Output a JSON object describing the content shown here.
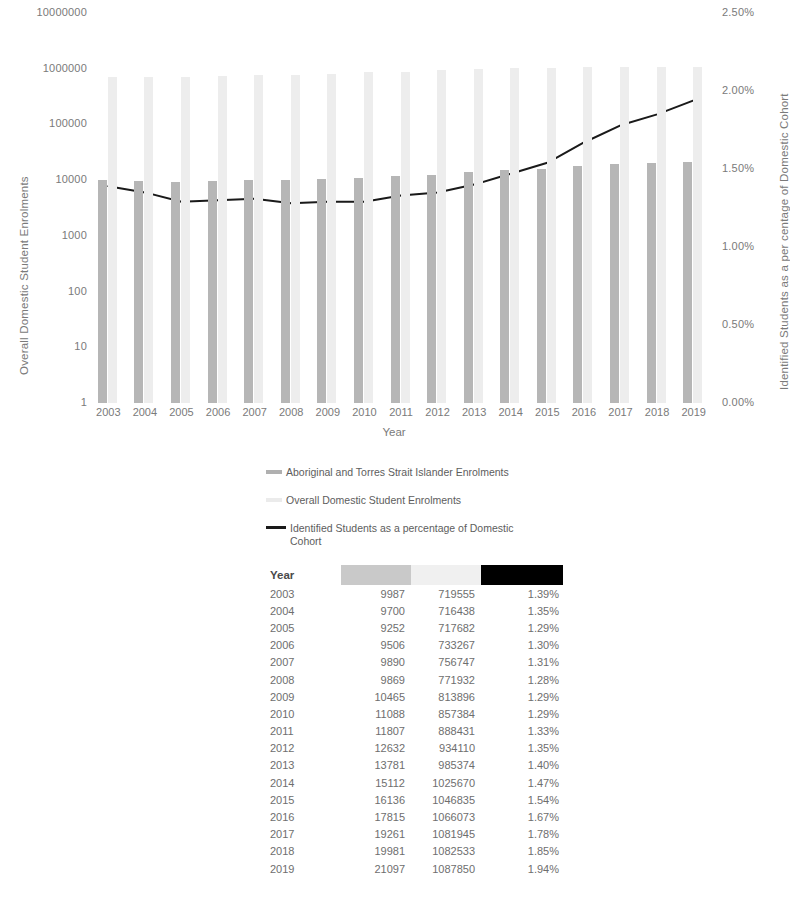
{
  "chart_data": {
    "type": "bar",
    "title": "",
    "xlabel": "Year",
    "ylabel": "Overall Domestic Student Enrolments",
    "y2label": "Identified Students as a per centage of Domestic Cohort",
    "grid": false,
    "legend_position": "bottom",
    "yscale": "log",
    "ylim": [
      1,
      10000000
    ],
    "y2lim": [
      0,
      0.025
    ],
    "yticks": [
      "1",
      "10",
      "100",
      "1000",
      "10000",
      "100000",
      "1000000",
      "10000000"
    ],
    "y2ticks": [
      "0.00%",
      "0.50%",
      "1.00%",
      "1.50%",
      "2.00%",
      "2.50%"
    ],
    "categories": [
      "2003",
      "2004",
      "2005",
      "2006",
      "2007",
      "2008",
      "2009",
      "2010",
      "2011",
      "2012",
      "2013",
      "2014",
      "2015",
      "2016",
      "2017",
      "2018",
      "2019"
    ],
    "series": [
      {
        "name": "Aboriginal and Torres Strait Islander Enrolments",
        "type": "bar",
        "axis": "left",
        "color": "#b6b6b6",
        "values": [
          9987,
          9700,
          9252,
          9506,
          9890,
          9869,
          10465,
          11088,
          11807,
          12632,
          13781,
          15112,
          16136,
          17815,
          19261,
          19981,
          21097
        ]
      },
      {
        "name": "Overall Domestic Student Enrolments",
        "type": "bar",
        "axis": "left",
        "color": "#ededed",
        "values": [
          719555,
          716438,
          717682,
          733267,
          756747,
          771932,
          813896,
          857384,
          888431,
          934110,
          985374,
          1025670,
          1046835,
          1066073,
          1081945,
          1082533,
          1087850
        ]
      },
      {
        "name": "Identified Students as a percentage of Domestic Cohort",
        "type": "line",
        "axis": "right",
        "color": "#1a1a1a",
        "values": [
          1.39,
          1.35,
          1.29,
          1.3,
          1.31,
          1.28,
          1.29,
          1.29,
          1.33,
          1.35,
          1.4,
          1.47,
          1.54,
          1.67,
          1.78,
          1.85,
          1.94
        ],
        "value_labels": [
          "1.39%",
          "1.35%",
          "1.29%",
          "1.30%",
          "1.31%",
          "1.28%",
          "1.29%",
          "1.29%",
          "1.33%",
          "1.35%",
          "1.40%",
          "1.47%",
          "1.54%",
          "1.67%",
          "1.78%",
          "1.85%",
          "1.94%"
        ]
      }
    ]
  },
  "legend": {
    "items": [
      {
        "marker": "bar-dark-swatch",
        "label": "Aboriginal and Torres Strait Islander Enrolments"
      },
      {
        "marker": "bar-light-swatch",
        "label": "Overall Domestic Student Enrolments"
      },
      {
        "marker": "line-black-swatch",
        "label": "Identified Students as a percentage of Domestic Cohort"
      }
    ]
  },
  "table": {
    "header": {
      "year": "Year",
      "swatch_colors": [
        "#c9c9c9",
        "#f0f0f0",
        "#000000"
      ]
    },
    "rows": [
      {
        "year": "2003",
        "indigenous": "9987",
        "overall": "719555",
        "pct": "1.39%"
      },
      {
        "year": "2004",
        "indigenous": "9700",
        "overall": "716438",
        "pct": "1.35%"
      },
      {
        "year": "2005",
        "indigenous": "9252",
        "overall": "717682",
        "pct": "1.29%"
      },
      {
        "year": "2006",
        "indigenous": "9506",
        "overall": "733267",
        "pct": "1.30%"
      },
      {
        "year": "2007",
        "indigenous": "9890",
        "overall": "756747",
        "pct": "1.31%"
      },
      {
        "year": "2008",
        "indigenous": "9869",
        "overall": "771932",
        "pct": "1.28%"
      },
      {
        "year": "2009",
        "indigenous": "10465",
        "overall": "813896",
        "pct": "1.29%"
      },
      {
        "year": "2010",
        "indigenous": "11088",
        "overall": "857384",
        "pct": "1.29%"
      },
      {
        "year": "2011",
        "indigenous": "11807",
        "overall": "888431",
        "pct": "1.33%"
      },
      {
        "year": "2012",
        "indigenous": "12632",
        "overall": "934110",
        "pct": "1.35%"
      },
      {
        "year": "2013",
        "indigenous": "13781",
        "overall": "985374",
        "pct": "1.40%"
      },
      {
        "year": "2014",
        "indigenous": "15112",
        "overall": "1025670",
        "pct": "1.47%"
      },
      {
        "year": "2015",
        "indigenous": "16136",
        "overall": "1046835",
        "pct": "1.54%"
      },
      {
        "year": "2016",
        "indigenous": "17815",
        "overall": "1066073",
        "pct": "1.67%"
      },
      {
        "year": "2017",
        "indigenous": "19261",
        "overall": "1081945",
        "pct": "1.78%"
      },
      {
        "year": "2018",
        "indigenous": "19981",
        "overall": "1082533",
        "pct": "1.85%"
      },
      {
        "year": "2019",
        "indigenous": "21097",
        "overall": "1087850",
        "pct": "1.94%"
      }
    ]
  }
}
